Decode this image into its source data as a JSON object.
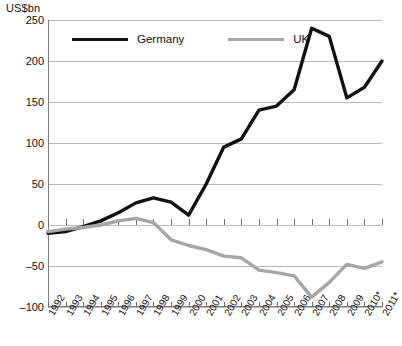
{
  "chart_data": {
    "type": "line",
    "title": "",
    "subtitle": "",
    "xlabel": "",
    "ylabel": "US$bn",
    "unit_label": "US$bn",
    "grid": true,
    "legend_position": "top-left-inside",
    "xlim": [
      1992,
      2011
    ],
    "ylim": [
      -100,
      250
    ],
    "ytick_step": 50,
    "yticks": [
      250,
      200,
      150,
      100,
      50,
      0,
      -50,
      -100
    ],
    "ytick_labels": [
      "250",
      "200",
      "150",
      "100",
      "50",
      "0",
      "–50",
      "–100"
    ],
    "categories": [
      "1992",
      "1993",
      "1994",
      "1995",
      "1996",
      "1997",
      "1998",
      "1999",
      "2000",
      "2001",
      "2002",
      "2003",
      "2004",
      "2005",
      "2006",
      "2007",
      "2008",
      "2009",
      "2010*",
      "2011*"
    ],
    "x": [
      1992,
      1993,
      1994,
      1995,
      1996,
      1997,
      1998,
      1999,
      2000,
      2001,
      2002,
      2003,
      2004,
      2005,
      2006,
      2007,
      2008,
      2009,
      2010,
      2011
    ],
    "annotations": [
      "* denotes forecast/estimate (asterisk on 2010 and 2011)"
    ],
    "series": [
      {
        "name": "Germany",
        "color": "#111111",
        "width": 3.4,
        "values": [
          -10,
          -8,
          -2,
          5,
          15,
          27,
          33,
          28,
          12,
          50,
          95,
          105,
          140,
          145,
          165,
          240,
          230,
          155,
          168,
          200
        ]
      },
      {
        "name": "UK",
        "color": "#a6a6a6",
        "width": 3.4,
        "values": [
          -8,
          -5,
          -3,
          0,
          5,
          8,
          3,
          -18,
          -25,
          -30,
          -38,
          -40,
          -55,
          -58,
          -62,
          -88,
          -70,
          -48,
          -53,
          -45
        ]
      }
    ]
  },
  "legend": {
    "items": [
      {
        "label": "Germany",
        "swatch": "germany"
      },
      {
        "label": "UK",
        "swatch": "uk"
      }
    ]
  },
  "colors": {
    "germany": "#111111",
    "uk": "#a6a6a6",
    "grid": "#b9b9b9",
    "axis": "#7d7d7d",
    "text": "#111111",
    "background": "#ffffff"
  }
}
